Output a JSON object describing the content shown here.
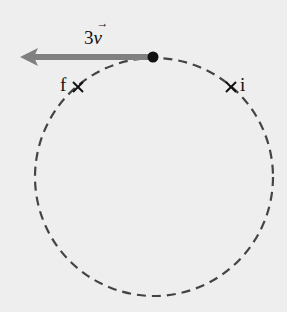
{
  "diagram": {
    "circle": {
      "cx": 154,
      "cy": 177,
      "r": 118,
      "style": "dashed",
      "color": "#444444"
    },
    "particle": {
      "x": 153,
      "y": 57,
      "color": "#111111"
    },
    "velocity_vector": {
      "label_coef": "3",
      "label_var": "v",
      "label_arrow": "→",
      "from_x": 153,
      "to_x": 20,
      "y": 57,
      "color": "#808080"
    },
    "points": [
      {
        "label": "f",
        "x": 78,
        "y": 87
      },
      {
        "label": "i",
        "x": 231,
        "y": 87
      }
    ]
  }
}
